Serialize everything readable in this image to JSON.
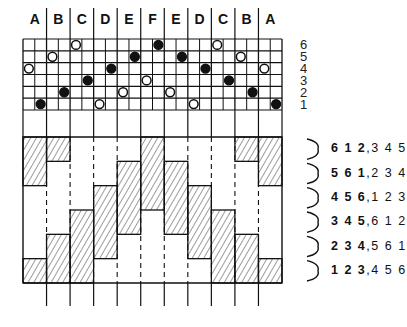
{
  "column_headers": [
    "A",
    "B",
    "C",
    "D",
    "E",
    "F",
    "E",
    "D",
    "C",
    "B",
    "A"
  ],
  "row_numbers": [
    "6",
    "5",
    "4",
    "3",
    "2",
    "1"
  ],
  "grid": {
    "cells_x": 22,
    "cells_y": 6,
    "circles": [
      {
        "row": 6,
        "cell": 4,
        "type": "open"
      },
      {
        "row": 6,
        "cell": 11,
        "type": "filled"
      },
      {
        "row": 6,
        "cell": 16,
        "type": "open"
      },
      {
        "row": 5,
        "cell": 2,
        "type": "open"
      },
      {
        "row": 5,
        "cell": 9,
        "type": "filled"
      },
      {
        "row": 5,
        "cell": 13,
        "type": "filled"
      },
      {
        "row": 5,
        "cell": 18,
        "type": "open"
      },
      {
        "row": 4,
        "cell": 0,
        "type": "open"
      },
      {
        "row": 4,
        "cell": 7,
        "type": "filled"
      },
      {
        "row": 4,
        "cell": 15,
        "type": "filled"
      },
      {
        "row": 4,
        "cell": 20,
        "type": "open"
      },
      {
        "row": 3,
        "cell": 5,
        "type": "filled"
      },
      {
        "row": 3,
        "cell": 10,
        "type": "open"
      },
      {
        "row": 3,
        "cell": 17,
        "type": "filled"
      },
      {
        "row": 2,
        "cell": 3,
        "type": "filled"
      },
      {
        "row": 2,
        "cell": 8,
        "type": "open"
      },
      {
        "row": 2,
        "cell": 12,
        "type": "open"
      },
      {
        "row": 2,
        "cell": 19,
        "type": "filled"
      },
      {
        "row": 1,
        "cell": 1,
        "type": "filled"
      },
      {
        "row": 1,
        "cell": 6,
        "type": "open"
      },
      {
        "row": 1,
        "cell": 14,
        "type": "open"
      },
      {
        "row": 1,
        "cell": 21,
        "type": "filled"
      }
    ]
  },
  "hatched_bands": [
    {
      "column": "A",
      "bands": [
        [
          1,
          2
        ],
        [
          6,
          6
        ]
      ]
    },
    {
      "column": "B",
      "bands": [
        [
          1,
          1
        ],
        [
          5,
          6
        ]
      ]
    },
    {
      "column": "C",
      "bands": [
        [
          4,
          6
        ]
      ]
    },
    {
      "column": "D",
      "bands": [
        [
          3,
          5
        ]
      ]
    },
    {
      "column": "E",
      "bands": [
        [
          2,
          4
        ]
      ]
    },
    {
      "column": "F",
      "bands": [
        [
          1,
          3
        ]
      ]
    },
    {
      "column": "E",
      "bands": [
        [
          2,
          4
        ]
      ]
    },
    {
      "column": "D",
      "bands": [
        [
          3,
          5
        ]
      ]
    },
    {
      "column": "C",
      "bands": [
        [
          4,
          6
        ]
      ]
    },
    {
      "column": "B",
      "bands": [
        [
          1,
          1
        ],
        [
          5,
          6
        ]
      ]
    },
    {
      "column": "A",
      "bands": [
        [
          1,
          2
        ],
        [
          6,
          6
        ]
      ]
    }
  ],
  "sequence_labels": [
    {
      "bold": "6 1 2",
      "regular": "3 4 5"
    },
    {
      "bold": "5 6 1",
      "regular": "2 3 4"
    },
    {
      "bold": "4 5 6",
      "regular": "1 2 3"
    },
    {
      "bold": "3 4 5",
      "regular": "6 1 2"
    },
    {
      "bold": "2 3 4",
      "regular": "5 6 1"
    },
    {
      "bold": "1 2 3",
      "regular": "4 5 6"
    }
  ],
  "colors": {
    "ink": "#111111",
    "background": "#ffffff"
  }
}
